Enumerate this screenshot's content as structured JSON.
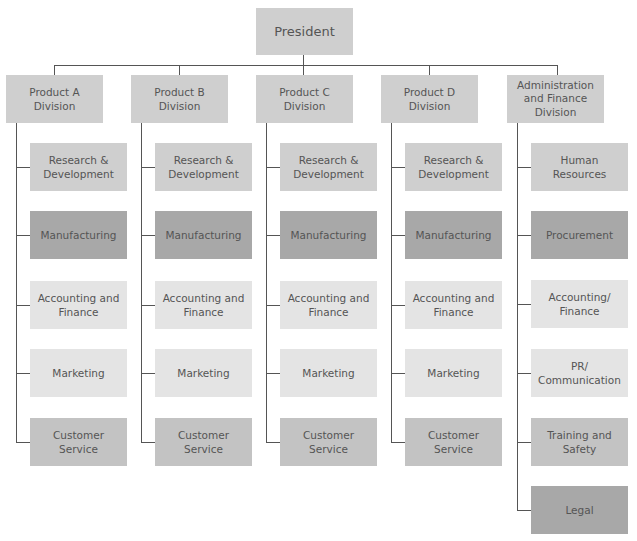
{
  "chart_data": {
    "type": "org-chart",
    "root": "President",
    "divisions": [
      {
        "name": "Product A\nDivision",
        "children": [
          "Research &\nDevelopment",
          "Manufacturing",
          "Accounting and\nFinance",
          "Marketing",
          "Customer Service"
        ]
      },
      {
        "name": "Product B\nDivision",
        "children": [
          "Research &\nDevelopment",
          "Manufacturing",
          "Accounting and\nFinance",
          "Marketing",
          "Customer Service"
        ]
      },
      {
        "name": "Product C\nDivision",
        "children": [
          "Research &\nDevelopment",
          "Manufacturing",
          "Accounting and\nFinance",
          "Marketing",
          "Customer Service"
        ]
      },
      {
        "name": "Product D\nDivision",
        "children": [
          "Research &\nDevelopment",
          "Manufacturing",
          "Accounting and\nFinance",
          "Marketing",
          "Customer Service"
        ]
      },
      {
        "name": "Administration\nand Finance\nDivision",
        "children": [
          "Human\nResources",
          "Procurement",
          "Accounting/\nFinance",
          "PR/\nCommunication",
          "Training and\nSafety",
          "Legal"
        ]
      }
    ]
  },
  "colors": {
    "light": "#e4e4e4",
    "mid": "#cfcfcf",
    "mid2": "#c3c3c3",
    "dark": "#a8a8a8",
    "line": "#555555",
    "text": "#555555"
  }
}
